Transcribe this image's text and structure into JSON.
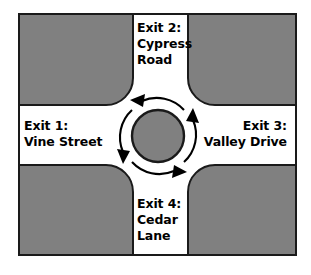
{
  "diagram": {
    "type": "roundabout-intersection-map",
    "circulation_direction": "counterclockwise",
    "colors": {
      "background": "#ffffff",
      "road": "#ffffff",
      "block_fill": "#808080",
      "outline": "#1a1a1a",
      "island_fill": "#808080",
      "text": "#000000"
    },
    "frame": {
      "x": 18,
      "y": 13,
      "width": 279,
      "height": 243,
      "stroke_width": 2
    },
    "roads": {
      "vertical": {
        "left": 133,
        "right": 188,
        "width": 55
      },
      "horizontal": {
        "top": 105,
        "bottom": 165,
        "height": 60
      }
    },
    "island": {
      "center_x": 158,
      "center_y": 136,
      "radius": 26
    },
    "circulation_arcs": {
      "radius": 37,
      "count": 4,
      "arrowhead_directions": [
        "left",
        "down",
        "right",
        "up"
      ]
    },
    "exits": [
      {
        "id": "exit-1",
        "number": "Exit 1:",
        "street": "Vine Street",
        "text": "Exit 1:\nVine Street",
        "position": "west",
        "align": "left"
      },
      {
        "id": "exit-2",
        "number": "Exit 2:",
        "street": "Cypress Road",
        "text": "Exit 2:\nCypress\nRoad",
        "position": "north",
        "align": "left"
      },
      {
        "id": "exit-3",
        "number": "Exit 3:",
        "street": "Valley Drive",
        "text": "Exit 3:\nValley Drive",
        "position": "east",
        "align": "right"
      },
      {
        "id": "exit-4",
        "number": "Exit 4:",
        "street": "Cedar Lane",
        "text": "Exit 4:\nCedar\nLane",
        "position": "south",
        "align": "left"
      }
    ]
  }
}
